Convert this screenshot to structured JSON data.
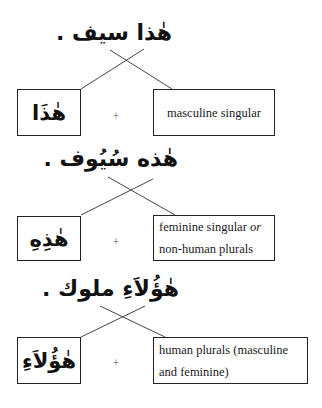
{
  "sections": [
    {
      "sentence": "هٰذا سيف .",
      "demonstrative": "هٰذَا",
      "plus": "+",
      "description_lines": [
        "masculine singular"
      ],
      "description_emphasis": ""
    },
    {
      "sentence": "هٰذه سُيُوف .",
      "demonstrative": "هٰذِهِ",
      "plus": "+",
      "description_lines": [
        "feminine singular ",
        "non-human plurals"
      ],
      "description_emphasis": "or"
    },
    {
      "sentence": "هٰؤُلاَءِ ملوك .",
      "demonstrative": "هٰؤُلاَءِ",
      "plus": "+",
      "description_lines": [
        "human plurals (masculine",
        "and feminine)"
      ],
      "description_emphasis": ""
    }
  ],
  "colors": {
    "line": "#444444",
    "box_border": "#222222",
    "plus": "#666666",
    "text": "#111111"
  }
}
